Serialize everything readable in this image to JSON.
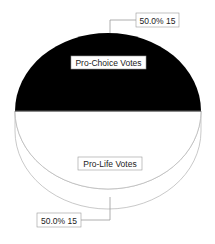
{
  "chart_data": {
    "type": "pie",
    "style": "3d",
    "title": "",
    "slices": [
      {
        "label": "Pro-Choice Votes",
        "value": 15,
        "percent": 50.0,
        "value_label": "50.0% 15",
        "color": "#000000"
      },
      {
        "label": "Pro-Life Votes",
        "value": 15,
        "percent": 50.0,
        "value_label": "50.0% 15",
        "color": "#ffffff"
      }
    ],
    "outline_color": "#bbbbbb",
    "legend": "none"
  }
}
